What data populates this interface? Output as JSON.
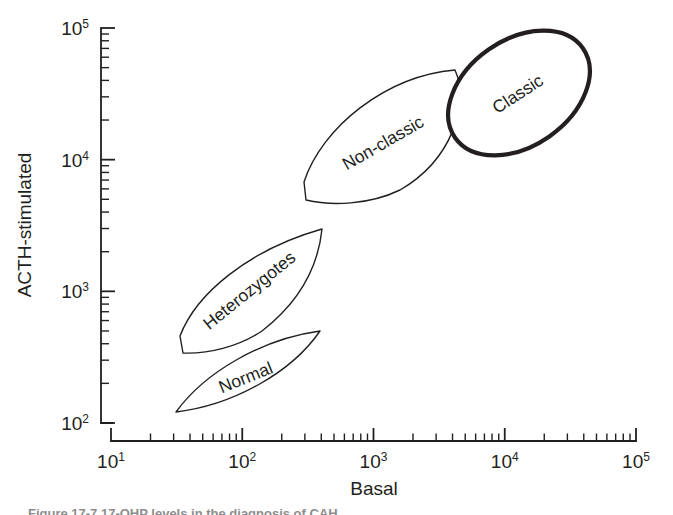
{
  "figure": {
    "caption_fragment": "Figure 17-7  17-OHP levels in the diagnosis of CAH"
  },
  "chart_data": {
    "type": "scatter",
    "title": "",
    "xlabel": "Basal",
    "ylabel": "ACTH-stimulated",
    "xscale": "log",
    "yscale": "log",
    "xlim": [
      10,
      100000
    ],
    "ylim": [
      100,
      100000
    ],
    "grid": false,
    "legend": "none",
    "x_tick_labels": [
      "10",
      "10",
      "10",
      "10",
      "10"
    ],
    "x_tick_exponents": [
      "1",
      "2",
      "3",
      "4",
      "5"
    ],
    "x_tick_values": [
      10,
      100,
      1000,
      10000,
      100000
    ],
    "y_tick_labels": [
      "10",
      "10",
      "10",
      "10"
    ],
    "y_tick_exponents": [
      "2",
      "3",
      "4",
      "5"
    ],
    "y_tick_values": [
      100,
      1000,
      10000,
      100000
    ],
    "regions": [
      {
        "name": "Normal",
        "label": "Normal",
        "style": "thin",
        "shape": "lens",
        "label_rotation": -22,
        "x_range": [
          30,
          500
        ],
        "y_range": [
          130,
          600
        ]
      },
      {
        "name": "Heterozygotes",
        "label": "Heterozygotes",
        "style": "thin",
        "shape": "lens",
        "label_rotation": -39,
        "x_range": [
          35,
          600
        ],
        "y_range": [
          380,
          3000
        ]
      },
      {
        "name": "Non-classic",
        "label": "Non-classic",
        "style": "thin",
        "shape": "lens",
        "label_rotation": -30,
        "x_range": [
          300,
          7000
        ],
        "y_range": [
          5000,
          40000
        ]
      },
      {
        "name": "Classic",
        "label": "Classic",
        "style": "bold",
        "shape": "ellipse",
        "label_rotation": -33,
        "x_range": [
          4000,
          60000
        ],
        "y_range": [
          15000,
          80000
        ]
      }
    ]
  }
}
